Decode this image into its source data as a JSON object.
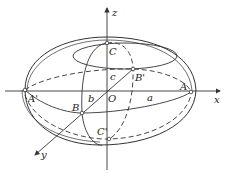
{
  "diagram": {
    "type": "ellipsoid",
    "colors": {
      "stroke": "#333333",
      "background": "#ffffff"
    },
    "axes": [
      {
        "name": "x",
        "label": "x"
      },
      {
        "name": "y",
        "label": "y"
      },
      {
        "name": "z",
        "label": "z"
      }
    ],
    "origin": {
      "label": "O"
    },
    "vertices": [
      {
        "id": "A",
        "label": "A"
      },
      {
        "id": "A_prime",
        "label": "A'"
      },
      {
        "id": "B",
        "label": "B"
      },
      {
        "id": "B_prime",
        "label": "B'"
      },
      {
        "id": "C",
        "label": "C"
      },
      {
        "id": "C_prime",
        "label": "C'"
      }
    ],
    "semi_axes": [
      {
        "id": "a",
        "label": "a"
      },
      {
        "id": "b",
        "label": "b"
      },
      {
        "id": "c",
        "label": "c"
      }
    ]
  }
}
